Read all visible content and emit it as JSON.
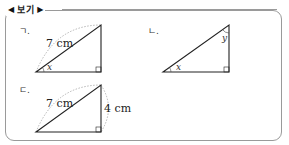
{
  "header": {
    "left_marker": "◀",
    "title": "보기",
    "right_marker": "▶"
  },
  "items": [
    {
      "label": "ㄱ.",
      "side_label": "7 cm",
      "angle_label": "x"
    },
    {
      "label": "ㄴ.",
      "angle_label_bottom": "x",
      "angle_label_top": "y"
    },
    {
      "label": "ㄷ.",
      "hyp_label": "7 cm",
      "side_label": "4 cm"
    }
  ]
}
